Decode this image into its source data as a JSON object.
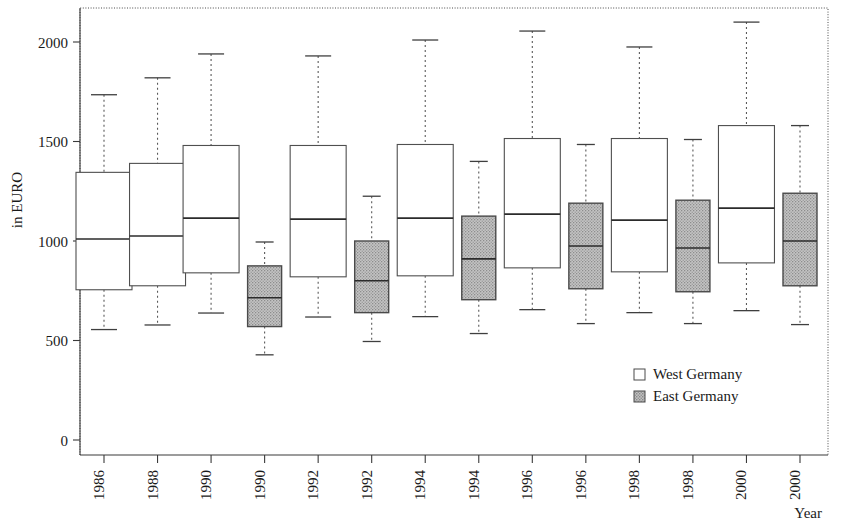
{
  "chart_data": {
    "type": "box",
    "title": "",
    "xlabel": "Year",
    "ylabel": "in EURO",
    "ylim": [
      0,
      2200
    ],
    "yticks": [
      0,
      500,
      1000,
      1500,
      2000
    ],
    "ytick_labels": [
      "0",
      "500",
      "1000",
      "1500",
      "2000"
    ],
    "grid": false,
    "legend_position": "bottom-right",
    "categories": [
      "1986",
      "1988",
      "1990",
      "1990",
      "1992",
      "1992",
      "1994",
      "1994",
      "1996",
      "1996",
      "1998",
      "1998",
      "2000",
      "2000"
    ],
    "legend": [
      {
        "name": "West Germany",
        "fill": "#ffffff",
        "pattern": "none"
      },
      {
        "name": "East Germany",
        "fill": "#b0b0b0",
        "pattern": "stipple"
      }
    ],
    "boxes": [
      {
        "label": "1986",
        "group": "West Germany",
        "whisker_low": 555,
        "q1": 755,
        "median": 1010,
        "q3": 1345,
        "whisker_high": 1735
      },
      {
        "label": "1988",
        "group": "West Germany",
        "whisker_low": 578,
        "q1": 775,
        "median": 1025,
        "q3": 1390,
        "whisker_high": 1820
      },
      {
        "label": "1990",
        "group": "West Germany",
        "whisker_low": 638,
        "q1": 840,
        "median": 1115,
        "q3": 1480,
        "whisker_high": 1940
      },
      {
        "label": "1990",
        "group": "East Germany",
        "whisker_low": 428,
        "q1": 570,
        "median": 715,
        "q3": 875,
        "whisker_high": 995
      },
      {
        "label": "1992",
        "group": "West Germany",
        "whisker_low": 618,
        "q1": 820,
        "median": 1110,
        "q3": 1480,
        "whisker_high": 1930
      },
      {
        "label": "1992",
        "group": "East Germany",
        "whisker_low": 495,
        "q1": 640,
        "median": 800,
        "q3": 1000,
        "whisker_high": 1225
      },
      {
        "label": "1994",
        "group": "West Germany",
        "whisker_low": 620,
        "q1": 825,
        "median": 1115,
        "q3": 1485,
        "whisker_high": 2010
      },
      {
        "label": "1994",
        "group": "East Germany",
        "whisker_low": 535,
        "q1": 705,
        "median": 910,
        "q3": 1125,
        "whisker_high": 1400
      },
      {
        "label": "1996",
        "group": "West Germany",
        "whisker_low": 655,
        "q1": 865,
        "median": 1135,
        "q3": 1515,
        "whisker_high": 2055
      },
      {
        "label": "1996",
        "group": "East Germany",
        "whisker_low": 585,
        "q1": 760,
        "median": 975,
        "q3": 1190,
        "whisker_high": 1485
      },
      {
        "label": "1998",
        "group": "West Germany",
        "whisker_low": 640,
        "q1": 845,
        "median": 1105,
        "q3": 1515,
        "whisker_high": 1975
      },
      {
        "label": "1998",
        "group": "East Germany",
        "whisker_low": 585,
        "q1": 745,
        "median": 965,
        "q3": 1205,
        "whisker_high": 1510
      },
      {
        "label": "2000",
        "group": "West Germany",
        "whisker_low": 650,
        "q1": 890,
        "median": 1165,
        "q3": 1580,
        "whisker_high": 2100
      },
      {
        "label": "2000",
        "group": "East Germany",
        "whisker_low": 580,
        "q1": 775,
        "median": 1000,
        "q3": 1240,
        "whisker_high": 1580
      }
    ]
  },
  "axes": {
    "y_title": "in EURO",
    "x_title": "Year"
  },
  "legend": {
    "west_label": "West Germany",
    "east_label": "East Germany"
  }
}
